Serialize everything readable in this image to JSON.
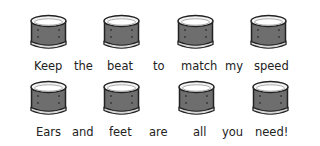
{
  "rows": [
    {
      "words": [
        "Keep",
        "the",
        "beat",
        "to",
        "match",
        "my",
        "speed"
      ]
    },
    {
      "words": [
        "Ears",
        "and",
        "feet",
        "are",
        "all",
        "you",
        "need!"
      ]
    }
  ],
  "drum_count_per_row": 4,
  "colors": {
    "drum_body": "#6e6e6e",
    "drum_rim": "#f2f2f2",
    "outline": "#222222"
  }
}
